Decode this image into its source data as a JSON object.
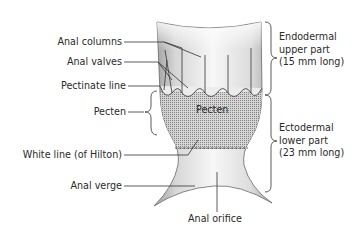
{
  "diagram": {
    "left_labels": {
      "anal_columns": "Anal columns",
      "anal_valves": "Anal valves",
      "pectinate_line": "Pectinate line",
      "pecten": "Pecten",
      "white_line": "White line (of Hilton)",
      "anal_verge": "Anal verge"
    },
    "center_labels": {
      "pecten_inside": "Pecten",
      "anal_orifice": "Anal orifice"
    },
    "right_labels": {
      "upper": "Endodermal\nupper part\n(15 mm long)",
      "lower": "Ectodermal\nlower part\n(23 mm long)"
    },
    "colors": {
      "wall_shade": "#9a9a9a",
      "lumen_light": "#f4f4f4",
      "pecten_dots": "#6e6e6e",
      "line": "#333333",
      "text": "#2a2a2a"
    }
  }
}
